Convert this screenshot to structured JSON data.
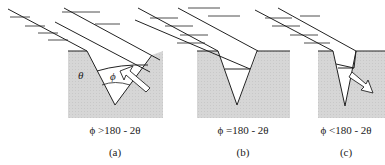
{
  "panels": [
    {
      "id": "a",
      "caption": "(a)",
      "condition": "ϕ >180 - 2θ",
      "angle_labels": {
        "theta": "θ",
        "phi": "ϕ"
      },
      "flow_direction": "up-left"
    },
    {
      "id": "b",
      "caption": "(b)",
      "condition": "ϕ =180 - 2θ",
      "flow_direction": "none"
    },
    {
      "id": "c",
      "caption": "(c)",
      "condition": "ϕ <180 - 2θ",
      "flow_direction": "down-right"
    }
  ],
  "colors": {
    "material_fill": "#d6d6d6",
    "line": "#222222",
    "arrow_fill": "#ffffff"
  }
}
